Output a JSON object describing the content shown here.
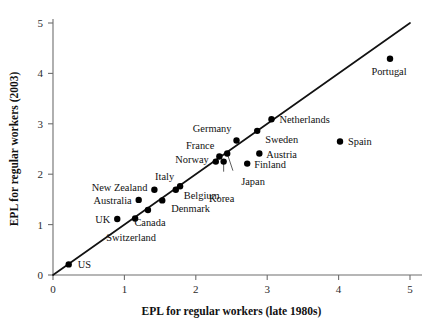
{
  "chart_data": {
    "type": "scatter",
    "title": "",
    "xlabel": "EPL for regular workers (late 1980s)",
    "ylabel": "EPL for regular workers (2003)",
    "xlim": [
      0,
      5
    ],
    "ylim": [
      0,
      5
    ],
    "xticks": [
      "0",
      "1",
      "2",
      "3",
      "4",
      "5"
    ],
    "yticks": [
      "0",
      "1",
      "2",
      "3",
      "4",
      "5"
    ],
    "grid": false,
    "legend": null,
    "reference_line": {
      "name": "45-degree-line",
      "from": [
        0,
        0
      ],
      "to": [
        5,
        5
      ]
    },
    "points": [
      {
        "label": "US",
        "x": 0.22,
        "y": 0.21,
        "label_dx": 9,
        "label_dy": 4,
        "anchor": "start"
      },
      {
        "label": "Switzerland",
        "x": 1.15,
        "y": 1.12,
        "label_dx": -4,
        "label_dy": 22,
        "anchor": "middle"
      },
      {
        "label": "Canada",
        "x": 1.33,
        "y": 1.29,
        "label_dx": 2,
        "label_dy": 16,
        "anchor": "middle"
      },
      {
        "label": "Denmark",
        "x": 1.53,
        "y": 1.48,
        "label_dx": 9,
        "label_dy": 12,
        "anchor": "start"
      },
      {
        "label": "Belgium",
        "x": 1.72,
        "y": 1.69,
        "label_dx": 8,
        "label_dy": 9,
        "anchor": "start"
      },
      {
        "label": "Italy",
        "x": 1.78,
        "y": 1.76,
        "label_dx": -6,
        "label_dy": -6,
        "anchor": "end"
      },
      {
        "label": "New Zealand",
        "x": 1.42,
        "y": 1.69,
        "label_dx": -7,
        "label_dy": 1,
        "anchor": "end"
      },
      {
        "label": "Australia",
        "x": 1.2,
        "y": 1.49,
        "label_dx": -7,
        "label_dy": 4,
        "anchor": "end"
      },
      {
        "label": "UK",
        "x": 0.9,
        "y": 1.11,
        "label_dx": -7,
        "label_dy": 4,
        "anchor": "end"
      },
      {
        "label": "Norway",
        "x": 2.28,
        "y": 2.25,
        "label_dx": -7,
        "label_dy": 1,
        "anchor": "end"
      },
      {
        "label": "France",
        "x": 2.33,
        "y": 2.35,
        "label_dx": -5,
        "label_dy": -8,
        "anchor": "end"
      },
      {
        "label": "Germany",
        "x": 2.57,
        "y": 2.67,
        "label_dx": -5,
        "label_dy": -8,
        "anchor": "end"
      },
      {
        "label": "Sweden",
        "x": 2.86,
        "y": 2.86,
        "label_dx": 8,
        "label_dy": 12,
        "anchor": "start"
      },
      {
        "label": "Netherlands",
        "x": 3.06,
        "y": 3.09,
        "label_dx": 8,
        "label_dy": 4,
        "anchor": "start"
      },
      {
        "label": "Korea",
        "x": 2.39,
        "y": 2.25,
        "label_dx": -2,
        "label_dy": 40,
        "anchor": "middle"
      },
      {
        "label": "Japan",
        "x": 2.44,
        "y": 2.41,
        "label_dx": 14,
        "label_dy": 31,
        "anchor": "start"
      },
      {
        "label": "Finland",
        "x": 2.72,
        "y": 2.21,
        "label_dx": 7,
        "label_dy": 4,
        "anchor": "start"
      },
      {
        "label": "Austria",
        "x": 2.89,
        "y": 2.41,
        "label_dx": 7,
        "label_dy": 4,
        "anchor": "start"
      },
      {
        "label": "Spain",
        "x": 4.02,
        "y": 2.65,
        "label_dx": 8,
        "label_dy": 4,
        "anchor": "start"
      },
      {
        "label": "Portugal",
        "x": 4.72,
        "y": 4.29,
        "label_dx": -1,
        "label_dy": 16,
        "anchor": "middle"
      }
    ],
    "leader_lines": [
      {
        "name": "korea-leader",
        "from": [
          2.39,
          2.05
        ],
        "to": [
          2.39,
          2.25
        ]
      },
      {
        "name": "japan-leader",
        "from": [
          2.52,
          2.07
        ],
        "to": [
          2.44,
          2.41
        ]
      }
    ]
  }
}
